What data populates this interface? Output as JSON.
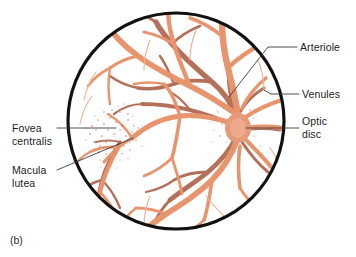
{
  "figure": {
    "caption": "(b)",
    "background_color": "#ffffff"
  },
  "colors": {
    "outline": "#111111",
    "arteriole": "#e8946d",
    "arteriole_light": "#f0ad8c",
    "venule": "#b5705a",
    "venule_dark": "#9c5f4c",
    "stipple": "#b08a78",
    "leader_line": "#3a3a3a",
    "label_text": "#1b1b1b"
  },
  "labels": {
    "arteriole": {
      "text": "Arteriole",
      "x": 300,
      "y": 48
    },
    "venules": {
      "text": "Venules",
      "x": 302,
      "y": 95
    },
    "optic_disc": {
      "text": "Optic\ndisc",
      "x": 302,
      "y": 124
    },
    "fovea_centralis": {
      "text": "Fovea\ncentralis",
      "x": 14,
      "y": 125
    },
    "macula_lutea": {
      "text": "Macula\nlutea",
      "x": 14,
      "y": 168
    }
  },
  "anatomy": {
    "eyeball_outline": {
      "cx": 176,
      "cy": 121,
      "r": 109,
      "stroke_width": 3.2
    },
    "optic_disc": {
      "cx": 238,
      "cy": 128,
      "rx": 15,
      "ry": 17,
      "note": "vessel convergence point, right side of fundus"
    },
    "macula_region": {
      "cx": 113,
      "cy": 134,
      "rx": 26,
      "ry": 21,
      "note": "stippled yellow area left of optic disc"
    },
    "fovea_centralis": {
      "cx": 113,
      "cy": 134,
      "note": "center of macula lutea"
    }
  },
  "leader_lines": {
    "arteriole": [
      [
        296,
        48
      ],
      [
        268,
        48
      ],
      [
        230,
        98
      ]
    ],
    "venules": [
      [
        298,
        95
      ],
      [
        272,
        95
      ]
    ],
    "venules_tick": [
      [
        272,
        95
      ],
      [
        266,
        92
      ]
    ],
    "optic_disc": [
      [
        298,
        128
      ],
      [
        246,
        128
      ]
    ],
    "fovea_centralis": [
      [
        58,
        128
      ],
      [
        113,
        128
      ]
    ],
    "macula_lutea": [
      [
        58,
        168
      ],
      [
        128,
        140
      ]
    ]
  },
  "vessels": {
    "description": "Branching retinal arterioles (light coral) and venules (darker brown) radiating from the optic disc.",
    "count_major_branches": 8
  }
}
